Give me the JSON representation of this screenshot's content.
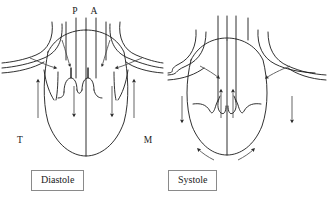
{
  "figure": {
    "background_color": "#ffffff",
    "line_color": "#1a1a1a",
    "flow_color": "#4a4a4a"
  },
  "panels": [
    {
      "id": "diastole",
      "caption": "Diastole",
      "description": "Heart chambers filling; atrioventricular valves open, semilunar valves closed",
      "labels": [
        {
          "key": "P",
          "text": "P",
          "meaning": "pulmonary-trunk",
          "x": 78,
          "y": 12
        },
        {
          "key": "A",
          "text": "A",
          "meaning": "aorta",
          "x": 96,
          "y": 12
        },
        {
          "key": "T",
          "text": "T",
          "meaning": "tricuspid-valve",
          "x": 20,
          "y": 140
        },
        {
          "key": "M",
          "text": "M",
          "meaning": "mitral-valve",
          "x": 147,
          "y": 140
        }
      ],
      "flow_direction": "inflow-downward",
      "semilunar_valves": "closed",
      "av_valves": "open"
    },
    {
      "id": "systole",
      "caption": "Systole",
      "description": "Heart chambers ejecting; semilunar valves open, atrioventricular valves closed",
      "labels": [],
      "flow_direction": "outflow-upward",
      "semilunar_valves": "open",
      "av_valves": "closed"
    }
  ]
}
